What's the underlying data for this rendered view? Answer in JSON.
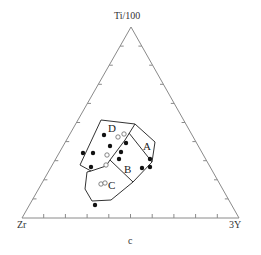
{
  "diagram": {
    "type": "ternary",
    "vertices": {
      "top": "Ti/100",
      "bottom_left": "Zr",
      "bottom_right": "3Y"
    },
    "caption": "c",
    "field_labels": [
      "A",
      "B",
      "C",
      "D"
    ],
    "ticks_per_side": 9,
    "colors": {
      "axis": "#8a8a8a",
      "field": "#333333",
      "point": "#111111"
    }
  },
  "points": {
    "filled": [
      [
        104,
        135
      ],
      [
        110,
        146
      ],
      [
        83,
        153
      ],
      [
        93,
        153
      ],
      [
        126,
        143
      ],
      [
        121,
        152
      ],
      [
        119,
        159
      ],
      [
        91,
        167
      ],
      [
        142,
        168
      ],
      [
        150,
        159
      ],
      [
        150,
        167
      ],
      [
        95,
        205
      ]
    ],
    "open": [
      [
        118,
        137
      ],
      [
        124,
        134
      ],
      [
        107,
        155
      ],
      [
        106,
        165
      ],
      [
        101,
        184
      ],
      [
        105,
        183
      ]
    ]
  }
}
